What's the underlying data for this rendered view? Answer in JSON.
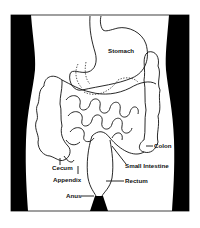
{
  "diagram": {
    "colors": {
      "outline": "#111111",
      "body_shadow": "#000000",
      "background": "#ffffff"
    },
    "labels": {
      "stomach": "Stomach",
      "colon": "Colon",
      "cecum": "Cecum",
      "appendix": "Appendix",
      "small_intestine": "Small Intestine",
      "rectum": "Rectum",
      "anus": "Anus"
    }
  }
}
